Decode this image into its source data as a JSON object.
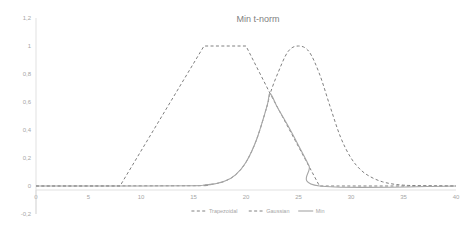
{
  "chart_data": {
    "type": "line",
    "title": "Min t-norm",
    "xlabel": "",
    "ylabel": "",
    "xlim": [
      0,
      40
    ],
    "ylim": [
      -0.2,
      1.2
    ],
    "grid": false,
    "legend_position": "bottom-center",
    "x_ticks": [
      "0",
      "5",
      "10",
      "15",
      "20",
      "25",
      "30",
      "35",
      "40"
    ],
    "x_tick_values": [
      0,
      5,
      10,
      15,
      20,
      25,
      30,
      35,
      40
    ],
    "y_ticks": [
      "-0,2",
      "0",
      "0,2",
      "0,4",
      "0,6",
      "0,8",
      "1",
      "1,2"
    ],
    "y_tick_values": [
      -0.2,
      0,
      0.2,
      0.4,
      0.6,
      0.8,
      1.0,
      1.2
    ],
    "series": [
      {
        "name": "Trapezoidal",
        "style": "dashed",
        "color": "#808080",
        "x": [
          0,
          8,
          16,
          20,
          22.3,
          27,
          40
        ],
        "values": [
          0,
          0,
          1,
          1,
          0.66,
          0,
          0
        ]
      },
      {
        "name": "Gaussian",
        "style": "dashed",
        "color": "#808080",
        "x": [
          0,
          15,
          16,
          17,
          18,
          19,
          20,
          21,
          22,
          22.3,
          23,
          24,
          25,
          26,
          27,
          28,
          29,
          30,
          31,
          32,
          33,
          34,
          35,
          36,
          38,
          40
        ],
        "values": [
          0,
          0.002,
          0.006,
          0.015,
          0.035,
          0.08,
          0.17,
          0.33,
          0.57,
          0.66,
          0.8,
          0.96,
          1.0,
          0.96,
          0.8,
          0.57,
          0.35,
          0.2,
          0.11,
          0.06,
          0.03,
          0.014,
          0.006,
          0.003,
          0.001,
          0
        ]
      },
      {
        "name": "Min",
        "style": "solid",
        "color": "#a6a6a6",
        "x": [
          0,
          8,
          15,
          16,
          17,
          18,
          19,
          20,
          21,
          22,
          22.3,
          23,
          24,
          25,
          26,
          27,
          40
        ],
        "values": [
          0,
          0,
          0.002,
          0.006,
          0.015,
          0.035,
          0.08,
          0.17,
          0.33,
          0.57,
          0.66,
          0.56,
          0.43,
          0.29,
          0.145,
          0,
          0
        ]
      }
    ]
  },
  "legend": {
    "items": [
      {
        "label": "Trapezoidal",
        "style": "dashed",
        "color": "#808080"
      },
      {
        "label": "Gaussian",
        "style": "dashed",
        "color": "#808080"
      },
      {
        "label": "Min",
        "style": "solid",
        "color": "#a6a6a6"
      }
    ]
  },
  "axes": {
    "x_axis_color": "#d9d9d9",
    "y_axis_color": "#d9d9d9"
  }
}
